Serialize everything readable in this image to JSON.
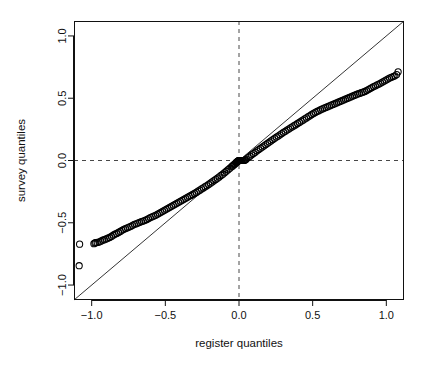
{
  "figure": {
    "background": "#ffffff",
    "foreground": "#111111",
    "plot_box": {
      "left": 74,
      "right": 404,
      "top": 21,
      "bottom": 300
    }
  },
  "chart_data": {
    "type": "scatter",
    "title": "",
    "xlabel": "register quantiles",
    "ylabel": "survey quantiles",
    "xlim": [
      -1.12,
      1.12
    ],
    "ylim": [
      -1.12,
      1.12
    ],
    "xticks": [
      -1.0,
      -0.5,
      0.0,
      0.5,
      1.0
    ],
    "yticks": [
      -1.0,
      -0.5,
      0.0,
      0.5,
      1.0
    ],
    "xticklabels": [
      "-1.0",
      "-0.5",
      "0.0",
      "0.5",
      "1.0"
    ],
    "yticklabels": [
      "-1.0",
      "-0.5",
      "0.0",
      "0.5",
      "1.0"
    ],
    "grid": false,
    "legend": null,
    "marker": "open-circle",
    "marker_size": 3.1,
    "marker_color": "#000000",
    "reference_lines": [
      {
        "name": "identity-line",
        "type": "abline",
        "slope": 1,
        "intercept": 0,
        "style": "solid",
        "color": "#000000",
        "width": 0.8
      },
      {
        "name": "vertical-zero-line",
        "type": "vline",
        "value": 0.0,
        "style": "dashed",
        "color": "#333333",
        "width": 0.9
      },
      {
        "name": "horizontal-zero-line",
        "type": "hline",
        "value": 0.0,
        "style": "dashed",
        "color": "#333333",
        "width": 0.9
      }
    ],
    "series": [
      {
        "name": "qq-points",
        "x": [
          -1.085,
          -1.082,
          -0.985,
          -0.978,
          -0.972,
          -0.962,
          -0.95,
          -0.938,
          -0.925,
          -0.914,
          -0.902,
          -0.89,
          -0.878,
          -0.866,
          -0.854,
          -0.842,
          -0.83,
          -0.818,
          -0.806,
          -0.794,
          -0.782,
          -0.77,
          -0.758,
          -0.746,
          -0.734,
          -0.722,
          -0.71,
          -0.698,
          -0.686,
          -0.674,
          -0.662,
          -0.65,
          -0.638,
          -0.626,
          -0.614,
          -0.602,
          -0.59,
          -0.578,
          -0.566,
          -0.554,
          -0.542,
          -0.53,
          -0.518,
          -0.506,
          -0.494,
          -0.482,
          -0.47,
          -0.458,
          -0.446,
          -0.434,
          -0.422,
          -0.41,
          -0.398,
          -0.386,
          -0.374,
          -0.362,
          -0.35,
          -0.338,
          -0.326,
          -0.314,
          -0.302,
          -0.29,
          -0.278,
          -0.266,
          -0.254,
          -0.242,
          -0.23,
          -0.218,
          -0.206,
          -0.194,
          -0.182,
          -0.17,
          -0.158,
          -0.146,
          -0.134,
          -0.122,
          -0.11,
          -0.098,
          -0.086,
          -0.074,
          -0.062,
          -0.05,
          -0.044,
          -0.038,
          -0.032,
          -0.026,
          -0.02,
          -0.016,
          -0.012,
          -0.008,
          -0.005,
          -0.002,
          0.0,
          0.002,
          0.005,
          0.008,
          0.012,
          0.016,
          0.02,
          0.026,
          0.032,
          0.038,
          0.044,
          0.05,
          0.062,
          0.074,
          0.086,
          0.098,
          0.11,
          0.122,
          0.134,
          0.146,
          0.158,
          0.17,
          0.182,
          0.194,
          0.206,
          0.218,
          0.23,
          0.242,
          0.254,
          0.266,
          0.278,
          0.29,
          0.302,
          0.314,
          0.326,
          0.338,
          0.35,
          0.362,
          0.374,
          0.386,
          0.398,
          0.41,
          0.422,
          0.434,
          0.446,
          0.458,
          0.47,
          0.482,
          0.494,
          0.506,
          0.518,
          0.53,
          0.542,
          0.554,
          0.566,
          0.578,
          0.59,
          0.602,
          0.614,
          0.626,
          0.638,
          0.65,
          0.662,
          0.674,
          0.686,
          0.698,
          0.71,
          0.722,
          0.734,
          0.746,
          0.758,
          0.77,
          0.782,
          0.794,
          0.806,
          0.818,
          0.83,
          0.842,
          0.854,
          0.866,
          0.878,
          0.89,
          0.902,
          0.914,
          0.926,
          0.938,
          0.95,
          0.962,
          0.974,
          0.986,
          0.998,
          1.01,
          1.022,
          1.034,
          1.046,
          1.058,
          1.07,
          1.08
        ],
        "y": [
          -0.845,
          -0.672,
          -0.668,
          -0.662,
          -0.66,
          -0.658,
          -0.655,
          -0.648,
          -0.64,
          -0.636,
          -0.63,
          -0.624,
          -0.618,
          -0.61,
          -0.6,
          -0.592,
          -0.586,
          -0.578,
          -0.57,
          -0.56,
          -0.552,
          -0.546,
          -0.54,
          -0.534,
          -0.528,
          -0.52,
          -0.512,
          -0.508,
          -0.502,
          -0.496,
          -0.49,
          -0.486,
          -0.48,
          -0.474,
          -0.466,
          -0.458,
          -0.452,
          -0.446,
          -0.44,
          -0.432,
          -0.424,
          -0.416,
          -0.408,
          -0.4,
          -0.392,
          -0.384,
          -0.376,
          -0.368,
          -0.36,
          -0.352,
          -0.344,
          -0.336,
          -0.328,
          -0.32,
          -0.312,
          -0.304,
          -0.296,
          -0.288,
          -0.28,
          -0.272,
          -0.264,
          -0.256,
          -0.246,
          -0.238,
          -0.228,
          -0.22,
          -0.21,
          -0.202,
          -0.192,
          -0.182,
          -0.172,
          -0.162,
          -0.152,
          -0.142,
          -0.132,
          -0.12,
          -0.11,
          -0.098,
          -0.086,
          -0.074,
          -0.062,
          -0.05,
          -0.044,
          -0.038,
          -0.032,
          -0.026,
          -0.018,
          -0.014,
          -0.01,
          -0.006,
          -0.004,
          -0.001,
          0.0,
          0.0,
          0.0,
          0.0,
          0.0,
          0.0,
          0.0,
          0.0,
          0.0,
          0.002,
          0.006,
          0.012,
          0.024,
          0.034,
          0.046,
          0.056,
          0.066,
          0.078,
          0.088,
          0.098,
          0.108,
          0.118,
          0.128,
          0.138,
          0.148,
          0.158,
          0.168,
          0.178,
          0.188,
          0.196,
          0.206,
          0.216,
          0.226,
          0.234,
          0.244,
          0.252,
          0.262,
          0.27,
          0.28,
          0.288,
          0.298,
          0.306,
          0.316,
          0.324,
          0.334,
          0.342,
          0.352,
          0.36,
          0.37,
          0.378,
          0.386,
          0.394,
          0.4,
          0.408,
          0.414,
          0.42,
          0.426,
          0.432,
          0.438,
          0.444,
          0.45,
          0.456,
          0.462,
          0.468,
          0.474,
          0.48,
          0.486,
          0.492,
          0.498,
          0.504,
          0.51,
          0.516,
          0.522,
          0.528,
          0.534,
          0.538,
          0.544,
          0.548,
          0.554,
          0.562,
          0.57,
          0.578,
          0.586,
          0.594,
          0.6,
          0.608,
          0.614,
          0.622,
          0.63,
          0.638,
          0.646,
          0.654,
          0.662,
          0.668,
          0.674,
          0.68,
          0.69,
          0.712
        ]
      }
    ]
  }
}
